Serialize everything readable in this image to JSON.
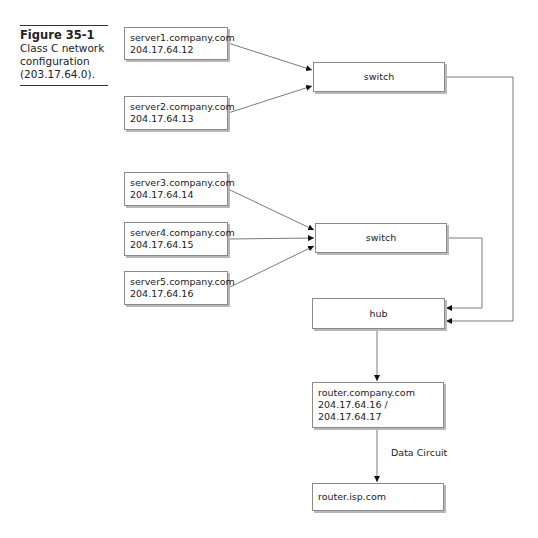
{
  "caption": {
    "figure_number": "Figure 35-1",
    "text_lines": [
      "Class C network",
      "configuration",
      "(203.17.64.0)."
    ]
  },
  "nodes": {
    "server1": {
      "hostname": "server1.company.com",
      "ip": "204.17.64.12"
    },
    "server2": {
      "hostname": "server2.company.com",
      "ip": "204.17.64.13"
    },
    "switch1": {
      "label": "switch"
    },
    "server3": {
      "hostname": "server3.company.com",
      "ip": "204.17.64.14"
    },
    "server4": {
      "hostname": "server4.company.com",
      "ip": "204.17.64.15"
    },
    "server5": {
      "hostname": "server5.company.com",
      "ip": "204.17.64.16"
    },
    "switch2": {
      "label": "switch"
    },
    "hub": {
      "label": "hub"
    },
    "router_company": {
      "hostname": "router.company.com",
      "ip_lines": [
        "204.17.64.16 /",
        "204.17.64.17"
      ]
    },
    "router_isp": {
      "hostname": "router.isp.com"
    }
  },
  "edges": {
    "data_circuit_label": "Data Circuit"
  },
  "colors": {
    "line": "#7a7a7a",
    "box_border": "#8a8a8a",
    "shadow": "#b8b8b8",
    "arrow": "#111111"
  }
}
